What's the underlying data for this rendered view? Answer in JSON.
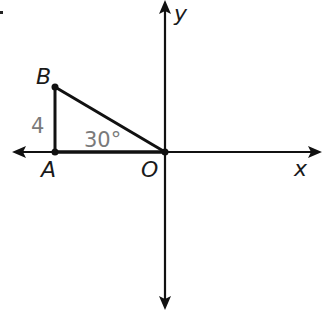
{
  "diagram": {
    "type": "coordinate-plane-triangle",
    "axes": {
      "x_label": "x",
      "y_label": "y"
    },
    "points": {
      "origin": {
        "label": "O"
      },
      "A": {
        "label": "A"
      },
      "B": {
        "label": "B"
      }
    },
    "side_AB_length": "4",
    "angle_at_O": "30°",
    "colors": {
      "line": "#111111",
      "measure_text": "#7a7a7a"
    }
  }
}
